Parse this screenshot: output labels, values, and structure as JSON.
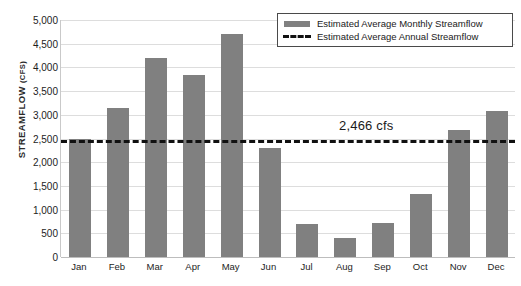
{
  "chart_data": {
    "type": "bar",
    "title": "",
    "subtitle": "",
    "xlabel": "",
    "ylabel": "STREAMFLOW (CFS)",
    "ylabel_main": "STREAMFLOW",
    "ylabel_unit": "(CFS)",
    "categories": [
      "Jan",
      "Feb",
      "Mar",
      "Apr",
      "May",
      "Jun",
      "Jul",
      "Aug",
      "Sep",
      "Oct",
      "Nov",
      "Dec"
    ],
    "series": [
      {
        "name": "Estimated Average Monthly Streamflow",
        "type": "bar",
        "color": "#808080",
        "values": [
          2500,
          3150,
          4200,
          3830,
          4700,
          2300,
          700,
          400,
          720,
          1320,
          2680,
          3070
        ]
      },
      {
        "name": "Estimated Average Annual Streamflow",
        "type": "line",
        "style": "dashed",
        "color": "#111111",
        "value": 2466
      }
    ],
    "ylim": [
      0,
      5000
    ],
    "ytick_values": [
      0,
      500,
      1000,
      1500,
      2000,
      2500,
      3000,
      3500,
      4000,
      4500,
      5000
    ],
    "ytick_labels": [
      "0",
      "500",
      "1,000",
      "1,500",
      "2,000",
      "2,500",
      "3,000",
      "3,500",
      "4,000",
      "4,500",
      "5,000"
    ],
    "grid": true,
    "legend_position": "top-right",
    "annotations": [
      {
        "text": "2,466 cfs",
        "value": 2466,
        "near_category": "Oct"
      }
    ]
  },
  "legend": {
    "items": [
      {
        "label": "Estimated Average Monthly Streamflow",
        "marker": "bar-swatch-icon"
      },
      {
        "label": "Estimated Average Annual Streamflow",
        "marker": "dashed-line-icon"
      }
    ]
  },
  "annotation": {
    "average_label": "2,466 cfs"
  }
}
